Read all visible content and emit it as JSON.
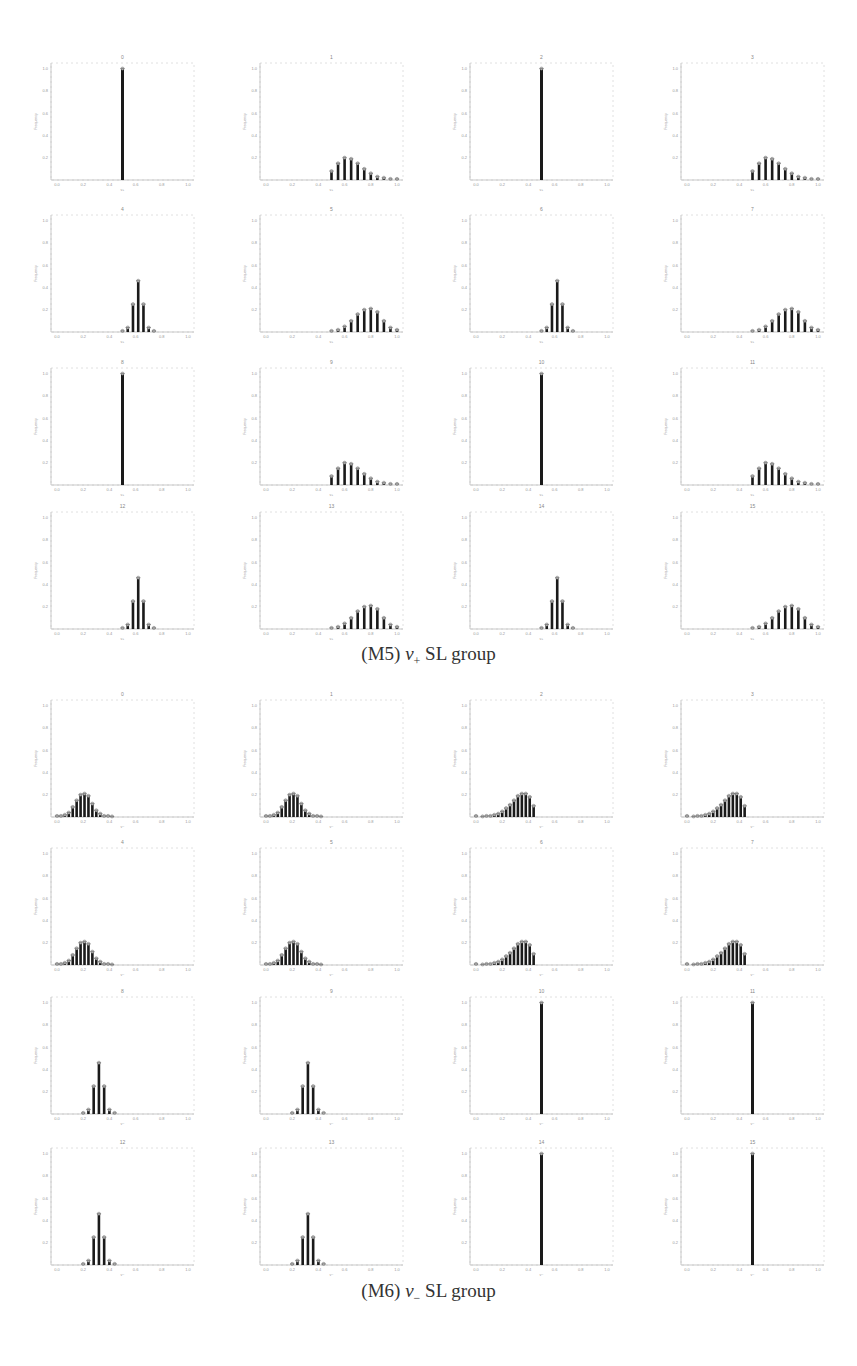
{
  "figure": {
    "groups": [
      {
        "id": "M5",
        "caption": "(M5) v+ SL group",
        "caption_parts": {
          "label": "(M5) ",
          "var": "v",
          "sub": "+",
          "rest": " SL group"
        },
        "panels": [
          {
            "title": "0",
            "shape": "spike",
            "center": 0.5
          },
          {
            "title": "1",
            "shape": "skew_right",
            "center": 0.6
          },
          {
            "title": "2",
            "shape": "spike",
            "center": 0.5
          },
          {
            "title": "3",
            "shape": "skew_right",
            "center": 0.6
          },
          {
            "title": "4",
            "shape": "narrow",
            "center": 0.6
          },
          {
            "title": "5",
            "shape": "wide",
            "center": 0.8
          },
          {
            "title": "6",
            "shape": "narrow",
            "center": 0.6
          },
          {
            "title": "7",
            "shape": "wide",
            "center": 0.8
          },
          {
            "title": "8",
            "shape": "spike",
            "center": 0.5
          },
          {
            "title": "9",
            "shape": "skew_right",
            "center": 0.6
          },
          {
            "title": "10",
            "shape": "spike",
            "center": 0.5
          },
          {
            "title": "11",
            "shape": "skew_right",
            "center": 0.6
          },
          {
            "title": "12",
            "shape": "narrow",
            "center": 0.6
          },
          {
            "title": "13",
            "shape": "wide",
            "center": 0.8
          },
          {
            "title": "14",
            "shape": "narrow",
            "center": 0.6
          },
          {
            "title": "15",
            "shape": "wide",
            "center": 0.8
          }
        ]
      },
      {
        "id": "M6",
        "caption": "(M6) v− SL group",
        "caption_parts": {
          "label": "(M6) ",
          "var": "v",
          "sub": "−",
          "rest": " SL group"
        },
        "panels": [
          {
            "title": "0",
            "shape": "wide_left",
            "center": 0.2
          },
          {
            "title": "1",
            "shape": "wide_left",
            "center": 0.2
          },
          {
            "title": "2",
            "shape": "skew_left",
            "center": 0.4
          },
          {
            "title": "3",
            "shape": "skew_left",
            "center": 0.4
          },
          {
            "title": "4",
            "shape": "wide_left",
            "center": 0.2
          },
          {
            "title": "5",
            "shape": "wide_left",
            "center": 0.2
          },
          {
            "title": "6",
            "shape": "skew_left",
            "center": 0.4
          },
          {
            "title": "7",
            "shape": "skew_left",
            "center": 0.4
          },
          {
            "title": "8",
            "shape": "narrow",
            "center": 0.3
          },
          {
            "title": "9",
            "shape": "narrow",
            "center": 0.3
          },
          {
            "title": "10",
            "shape": "spike",
            "center": 0.5
          },
          {
            "title": "11",
            "shape": "spike",
            "center": 0.5
          },
          {
            "title": "12",
            "shape": "narrow",
            "center": 0.3
          },
          {
            "title": "13",
            "shape": "narrow",
            "center": 0.3
          },
          {
            "title": "14",
            "shape": "spike",
            "center": 0.5
          },
          {
            "title": "15",
            "shape": "spike",
            "center": 0.5
          }
        ]
      }
    ]
  },
  "chart_data": [
    {
      "type": "bar",
      "title": "(M5) v+ SL group",
      "layout": "4x4 grid of histogram subplots",
      "xlabel": "v+",
      "ylabel": "Frequency",
      "xlim": [
        0.0,
        1.0
      ],
      "ylim": [
        0.0,
        1.05
      ],
      "xticks": [
        "0.0",
        "0.2",
        "0.4",
        "0.6",
        "0.8",
        "1.0"
      ],
      "yticks": [
        "0.2",
        "0.4",
        "0.6",
        "0.8",
        "1.0"
      ],
      "grid": false,
      "subplots": [
        {
          "title": "0",
          "x": [
            0.5
          ],
          "values": [
            1.0
          ]
        },
        {
          "title": "1",
          "x": [
            0.5,
            0.55,
            0.6,
            0.65,
            0.7,
            0.75,
            0.8,
            0.85,
            0.9,
            0.95,
            1.0
          ],
          "values": [
            0.08,
            0.15,
            0.2,
            0.19,
            0.15,
            0.1,
            0.06,
            0.03,
            0.02,
            0.01,
            0.01
          ]
        },
        {
          "title": "2",
          "x": [
            0.5
          ],
          "values": [
            1.0
          ]
        },
        {
          "title": "3",
          "x": [
            0.5,
            0.55,
            0.6,
            0.65,
            0.7,
            0.75,
            0.8,
            0.85,
            0.9,
            0.95,
            1.0
          ],
          "values": [
            0.08,
            0.15,
            0.2,
            0.19,
            0.15,
            0.1,
            0.06,
            0.03,
            0.02,
            0.01,
            0.01
          ]
        },
        {
          "title": "4",
          "x": [
            0.5,
            0.54,
            0.58,
            0.62,
            0.66,
            0.7,
            0.74
          ],
          "values": [
            0.01,
            0.04,
            0.25,
            0.46,
            0.25,
            0.04,
            0.01
          ]
        },
        {
          "title": "5",
          "x": [
            0.5,
            0.55,
            0.6,
            0.65,
            0.7,
            0.75,
            0.8,
            0.85,
            0.9,
            0.95,
            1.0
          ],
          "values": [
            0.01,
            0.02,
            0.05,
            0.1,
            0.16,
            0.2,
            0.21,
            0.18,
            0.1,
            0.04,
            0.02
          ]
        },
        {
          "title": "6",
          "x": [
            0.5,
            0.54,
            0.58,
            0.62,
            0.66,
            0.7,
            0.74
          ],
          "values": [
            0.01,
            0.04,
            0.25,
            0.46,
            0.25,
            0.04,
            0.01
          ]
        },
        {
          "title": "7",
          "x": [
            0.5,
            0.55,
            0.6,
            0.65,
            0.7,
            0.75,
            0.8,
            0.85,
            0.9,
            0.95,
            1.0
          ],
          "values": [
            0.01,
            0.02,
            0.05,
            0.1,
            0.16,
            0.2,
            0.21,
            0.18,
            0.1,
            0.04,
            0.02
          ]
        },
        {
          "title": "8",
          "x": [
            0.5
          ],
          "values": [
            1.0
          ]
        },
        {
          "title": "9",
          "x": [
            0.5,
            0.55,
            0.6,
            0.65,
            0.7,
            0.75,
            0.8,
            0.85,
            0.9,
            0.95,
            1.0
          ],
          "values": [
            0.08,
            0.15,
            0.2,
            0.19,
            0.15,
            0.1,
            0.06,
            0.03,
            0.02,
            0.01,
            0.01
          ]
        },
        {
          "title": "10",
          "x": [
            0.5
          ],
          "values": [
            1.0
          ]
        },
        {
          "title": "11",
          "x": [
            0.5,
            0.55,
            0.6,
            0.65,
            0.7,
            0.75,
            0.8,
            0.85,
            0.9,
            0.95,
            1.0
          ],
          "values": [
            0.08,
            0.15,
            0.2,
            0.19,
            0.15,
            0.1,
            0.06,
            0.03,
            0.02,
            0.01,
            0.01
          ]
        },
        {
          "title": "12",
          "x": [
            0.5,
            0.54,
            0.58,
            0.62,
            0.66,
            0.7,
            0.74
          ],
          "values": [
            0.01,
            0.04,
            0.25,
            0.46,
            0.25,
            0.04,
            0.01
          ]
        },
        {
          "title": "13",
          "x": [
            0.5,
            0.55,
            0.6,
            0.65,
            0.7,
            0.75,
            0.8,
            0.85,
            0.9,
            0.95,
            1.0
          ],
          "values": [
            0.01,
            0.02,
            0.05,
            0.1,
            0.16,
            0.2,
            0.21,
            0.18,
            0.1,
            0.04,
            0.02
          ]
        },
        {
          "title": "14",
          "x": [
            0.5,
            0.54,
            0.58,
            0.62,
            0.66,
            0.7,
            0.74
          ],
          "values": [
            0.01,
            0.04,
            0.25,
            0.46,
            0.25,
            0.04,
            0.01
          ]
        },
        {
          "title": "15",
          "x": [
            0.5,
            0.55,
            0.6,
            0.65,
            0.7,
            0.75,
            0.8,
            0.85,
            0.9,
            0.95,
            1.0
          ],
          "values": [
            0.01,
            0.02,
            0.05,
            0.1,
            0.16,
            0.2,
            0.21,
            0.18,
            0.1,
            0.04,
            0.02
          ]
        }
      ]
    },
    {
      "type": "bar",
      "title": "(M6) v− SL group",
      "layout": "4x4 grid of histogram subplots",
      "xlabel": "v−",
      "ylabel": "Frequency",
      "xlim": [
        0.0,
        1.0
      ],
      "ylim": [
        0.0,
        1.05
      ],
      "xticks": [
        "0.0",
        "0.2",
        "0.4",
        "0.6",
        "0.8",
        "1.0"
      ],
      "yticks": [
        "0.2",
        "0.4",
        "0.6",
        "0.8",
        "1.0"
      ],
      "grid": false,
      "subplots": [
        {
          "title": "0",
          "x": [
            0.0,
            0.03,
            0.06,
            0.09,
            0.12,
            0.15,
            0.18,
            0.21,
            0.24,
            0.27,
            0.3,
            0.33,
            0.36,
            0.39,
            0.42
          ],
          "values": [
            0.01,
            0.01,
            0.02,
            0.04,
            0.09,
            0.15,
            0.2,
            0.21,
            0.19,
            0.12,
            0.06,
            0.03,
            0.01,
            0.01,
            0.005
          ]
        },
        {
          "title": "1",
          "x": [
            0.0,
            0.03,
            0.06,
            0.09,
            0.12,
            0.15,
            0.18,
            0.21,
            0.24,
            0.27,
            0.3,
            0.33,
            0.36,
            0.39,
            0.42
          ],
          "values": [
            0.01,
            0.01,
            0.02,
            0.04,
            0.09,
            0.15,
            0.2,
            0.21,
            0.19,
            0.12,
            0.06,
            0.03,
            0.01,
            0.01,
            0.005
          ]
        },
        {
          "title": "2",
          "x": [
            0.0,
            0.05,
            0.08,
            0.11,
            0.14,
            0.17,
            0.2,
            0.23,
            0.26,
            0.29,
            0.32,
            0.35,
            0.38,
            0.41,
            0.44,
            0.47
          ],
          "values": [
            0.01,
            0.005,
            0.01,
            0.01,
            0.02,
            0.03,
            0.05,
            0.08,
            0.11,
            0.15,
            0.19,
            0.21,
            0.21,
            0.18,
            0.1,
            0.0
          ]
        },
        {
          "title": "3",
          "x": [
            0.0,
            0.05,
            0.08,
            0.11,
            0.14,
            0.17,
            0.2,
            0.23,
            0.26,
            0.29,
            0.32,
            0.35,
            0.38,
            0.41,
            0.44,
            0.47
          ],
          "values": [
            0.01,
            0.005,
            0.01,
            0.01,
            0.02,
            0.03,
            0.05,
            0.08,
            0.11,
            0.15,
            0.19,
            0.21,
            0.21,
            0.18,
            0.1,
            0.0
          ]
        },
        {
          "title": "4",
          "x": [
            0.0,
            0.03,
            0.06,
            0.09,
            0.12,
            0.15,
            0.18,
            0.21,
            0.24,
            0.27,
            0.3,
            0.33,
            0.36,
            0.39,
            0.42
          ],
          "values": [
            0.01,
            0.01,
            0.02,
            0.04,
            0.09,
            0.15,
            0.2,
            0.21,
            0.19,
            0.12,
            0.06,
            0.03,
            0.01,
            0.01,
            0.005
          ]
        },
        {
          "title": "5",
          "x": [
            0.0,
            0.03,
            0.06,
            0.09,
            0.12,
            0.15,
            0.18,
            0.21,
            0.24,
            0.27,
            0.3,
            0.33,
            0.36,
            0.39,
            0.42
          ],
          "values": [
            0.01,
            0.01,
            0.02,
            0.04,
            0.09,
            0.15,
            0.2,
            0.21,
            0.19,
            0.12,
            0.06,
            0.03,
            0.01,
            0.01,
            0.005
          ]
        },
        {
          "title": "6",
          "x": [
            0.0,
            0.05,
            0.08,
            0.11,
            0.14,
            0.17,
            0.2,
            0.23,
            0.26,
            0.29,
            0.32,
            0.35,
            0.38,
            0.41,
            0.44,
            0.47
          ],
          "values": [
            0.01,
            0.005,
            0.01,
            0.01,
            0.02,
            0.03,
            0.05,
            0.08,
            0.11,
            0.15,
            0.19,
            0.21,
            0.21,
            0.18,
            0.1,
            0.0
          ]
        },
        {
          "title": "7",
          "x": [
            0.0,
            0.05,
            0.08,
            0.11,
            0.14,
            0.17,
            0.2,
            0.23,
            0.26,
            0.29,
            0.32,
            0.35,
            0.38,
            0.41,
            0.44,
            0.47
          ],
          "values": [
            0.01,
            0.005,
            0.01,
            0.01,
            0.02,
            0.03,
            0.05,
            0.08,
            0.11,
            0.15,
            0.19,
            0.21,
            0.21,
            0.18,
            0.1,
            0.0
          ]
        },
        {
          "title": "8",
          "x": [
            0.2,
            0.24,
            0.28,
            0.32,
            0.36,
            0.4,
            0.44
          ],
          "values": [
            0.01,
            0.04,
            0.25,
            0.46,
            0.25,
            0.04,
            0.01
          ]
        },
        {
          "title": "9",
          "x": [
            0.2,
            0.24,
            0.28,
            0.32,
            0.36,
            0.4,
            0.44
          ],
          "values": [
            0.01,
            0.04,
            0.25,
            0.46,
            0.25,
            0.04,
            0.01
          ]
        },
        {
          "title": "10",
          "x": [
            0.5
          ],
          "values": [
            1.0
          ]
        },
        {
          "title": "11",
          "x": [
            0.5
          ],
          "values": [
            1.0
          ]
        },
        {
          "title": "12",
          "x": [
            0.2,
            0.24,
            0.28,
            0.32,
            0.36,
            0.4,
            0.44
          ],
          "values": [
            0.01,
            0.04,
            0.25,
            0.46,
            0.25,
            0.04,
            0.01
          ]
        },
        {
          "title": "13",
          "x": [
            0.2,
            0.24,
            0.28,
            0.32,
            0.36,
            0.4,
            0.44
          ],
          "values": [
            0.01,
            0.04,
            0.25,
            0.46,
            0.25,
            0.04,
            0.01
          ]
        },
        {
          "title": "14",
          "x": [
            0.5
          ],
          "values": [
            1.0
          ]
        },
        {
          "title": "15",
          "x": [
            0.5
          ],
          "values": [
            1.0
          ]
        }
      ]
    }
  ],
  "layout": {
    "columns_x": [
      51,
      260,
      470,
      681
    ],
    "groups": [
      {
        "rows_top": [
          63,
          215,
          368,
          512
        ],
        "caption_top": 643
      },
      {
        "rows_top": [
          700,
          848,
          997,
          1148
        ],
        "caption_top": 1280
      }
    ],
    "panel_w": 143,
    "panel_h": 117
  }
}
